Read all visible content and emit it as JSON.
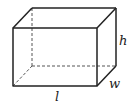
{
  "diagram": {
    "type": "rectangular-prism",
    "labels": {
      "length": "l",
      "width": "w",
      "height": "h"
    },
    "colors": {
      "stroke": "#222222",
      "background": "#ffffff"
    }
  }
}
